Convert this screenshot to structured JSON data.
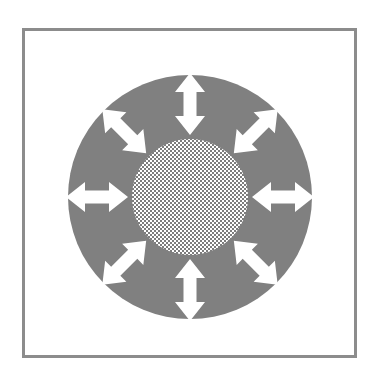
{
  "figure": {
    "frame": {
      "name": "outer-frame",
      "border_color": "#8c8c8c",
      "border_width_px": 3,
      "fill_color": "#ffffff",
      "x": 22,
      "y": 28,
      "width": 335,
      "height": 330
    },
    "outer_disc": {
      "name": "outer-gray-disc",
      "fill_color": "#808080",
      "center_x": 190,
      "center_y": 197,
      "radius": 122
    },
    "inner_disc": {
      "name": "inner-checkered-disc",
      "pattern": "checkerboard",
      "pattern_cell_px": 2,
      "pattern_color_a": "#7d7d7d",
      "pattern_color_b": "#ffffff",
      "center_x": 190,
      "center_y": 197,
      "radius": 58
    },
    "arrow_style": {
      "name": "double-headed-arrow",
      "fill_color": "#ffffff",
      "count": 8,
      "length_px": 62,
      "shaft_width_px": 13,
      "head_width_px": 30,
      "head_length_px": 19
    },
    "arrows": [
      {
        "name": "arrow-north",
        "label": "N",
        "angle_deg": 270,
        "direction": "up"
      },
      {
        "name": "arrow-northeast",
        "label": "NE",
        "angle_deg": 315,
        "direction": "up-right"
      },
      {
        "name": "arrow-east",
        "label": "E",
        "angle_deg": 0,
        "direction": "right"
      },
      {
        "name": "arrow-southeast",
        "label": "SE",
        "angle_deg": 45,
        "direction": "down-right"
      },
      {
        "name": "arrow-south",
        "label": "S",
        "angle_deg": 90,
        "direction": "down"
      },
      {
        "name": "arrow-southwest",
        "label": "SW",
        "angle_deg": 135,
        "direction": "down-left"
      },
      {
        "name": "arrow-west",
        "label": "W",
        "angle_deg": 180,
        "direction": "left"
      },
      {
        "name": "arrow-northwest",
        "label": "NW",
        "angle_deg": 225,
        "direction": "up-left"
      }
    ],
    "arrow_radius_from_center": 93,
    "canvas": {
      "width": 378,
      "height": 377,
      "background": "#ffffff"
    }
  }
}
